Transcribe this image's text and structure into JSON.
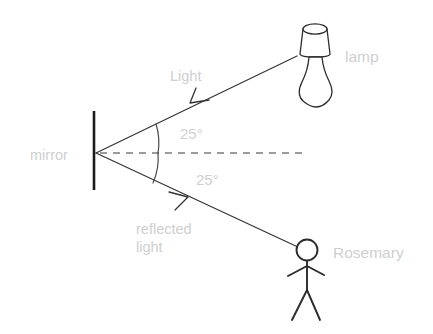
{
  "diagram": {
    "background_color": "#ffffff",
    "label_color": "#cfcfcf",
    "line_color": "#2b2b2b",
    "labels": {
      "mirror": "mirror",
      "lamp": "lamp",
      "person": "Rosemary",
      "incident_ray": "Light",
      "reflected_ray_line1": "reflected",
      "reflected_ray_line2": "light",
      "angle_incidence": "25°",
      "angle_reflection": "25°"
    },
    "elements": {
      "mirror_surface": "vertical-mirror-line",
      "normal_line": "dashed-normal-line",
      "incident_ray": "ray-from-lamp-to-mirror",
      "reflected_ray": "ray-from-mirror-to-person",
      "lamp_icon": "lamp-icon",
      "person_icon": "stick-figure-icon",
      "incidence_arc": "angle-arc-upper",
      "reflection_arc": "angle-arc-lower"
    },
    "geometry": {
      "mirror_x": 94,
      "mirror_top_y": 111,
      "mirror_bottom_y": 190,
      "vertex_x": 96,
      "vertex_y": 153,
      "normal_end_x": 305,
      "incident_source_x": 298,
      "incident_source_y": 56,
      "reflected_end_x": 298,
      "reflected_end_y": 247,
      "angle_degrees": 25
    }
  }
}
